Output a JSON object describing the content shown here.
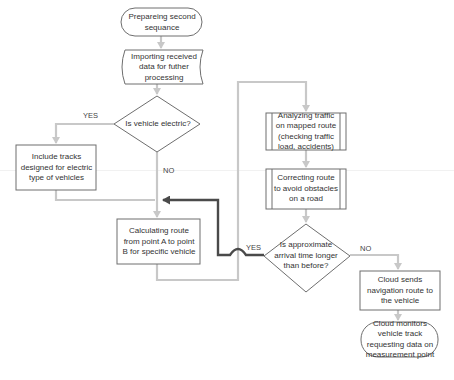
{
  "colors": {
    "background": "#ffffff",
    "shape_stroke": "#6e6e6e",
    "connector": "#c8c8c8",
    "highlight_connector": "#4a4a4a",
    "text": "#333333"
  },
  "nodes": {
    "start": {
      "type": "terminator",
      "text": "Prepareing second sequance"
    },
    "import": {
      "type": "stored-data",
      "text": "Importing received data for futher processing"
    },
    "decision_electric": {
      "type": "decision",
      "text": "Is vehicle electric?"
    },
    "include_tracks": {
      "type": "process",
      "text": "Include tracks designed for electric type of vehicles"
    },
    "calculate_route": {
      "type": "process",
      "text": "Calculating route from point A to point B for specific vehicle"
    },
    "analyze_traffic": {
      "type": "predefined-process",
      "text": "Analyzing traffic on mapped route (checking traffic load, accidents)"
    },
    "correct_route": {
      "type": "predefined-process",
      "text": "Correcting route to avoid obstacles on a road"
    },
    "decision_arrival": {
      "type": "decision",
      "text": "Is approximate arrival time longer than before?"
    },
    "send_route": {
      "type": "process",
      "text": "Cloud sends navigation route to the vehicle"
    },
    "monitor": {
      "type": "terminator",
      "text": "Cloud monitors vehicle track requesting data on measurement point"
    }
  },
  "edge_labels": {
    "electric_yes": "YES",
    "electric_no": "NO",
    "arrival_yes": "YES",
    "arrival_no": "NO"
  }
}
